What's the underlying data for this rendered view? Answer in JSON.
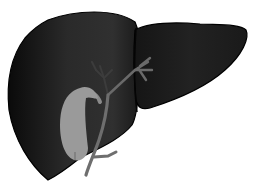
{
  "figure": {
    "colors": {
      "background": "#ffffff",
      "liver_dark": "#0e0e0e",
      "liver_mid": "#2a2a2a",
      "liver_outline": "#000000",
      "gallbladder": "#9a9a9a",
      "bile_duct": "#6e6e6e",
      "bile_duct_faint": "#3c3c3c"
    }
  }
}
